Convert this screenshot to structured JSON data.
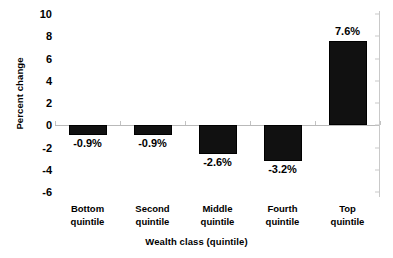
{
  "chart_data": {
    "type": "bar",
    "title": "",
    "subtitle": "",
    "xlabel": "Wealth class (quintile)",
    "ylabel": "Percent change",
    "categories": [
      "Bottom\nquintile",
      "Second\nquintile",
      "Middle\nquintile",
      "Fourth\nquintile",
      "Top quintile"
    ],
    "values": [
      -0.9,
      -0.9,
      -2.6,
      -3.2,
      7.6
    ],
    "data_labels": [
      "-0.9%",
      "-0.9%",
      "-2.6%",
      "-3.2%",
      "7.6%"
    ],
    "ylim": [
      -6,
      10
    ],
    "ytick_values": [
      10,
      8,
      6,
      4,
      2,
      0,
      -2,
      -4,
      -6
    ],
    "ytick_labels": [
      "10",
      "8",
      "6",
      "4",
      "2",
      "0",
      "-2",
      "-4",
      "-6"
    ],
    "grid": false,
    "legend": null,
    "bar_color": "#111111",
    "axis_color": "#b9b9b9",
    "text_color": "#000000"
  }
}
